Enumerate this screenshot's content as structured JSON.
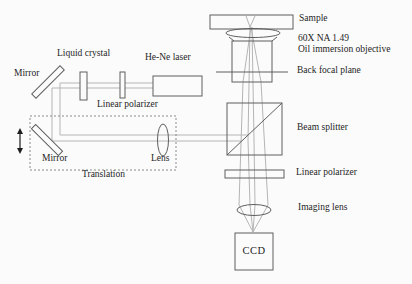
{
  "colors": {
    "background": "#fbfbfb",
    "outline": "#5f5f5f",
    "beam": "#b5b5b5",
    "dotted_box": "#8a8a8a",
    "text": "#1e1e1e"
  },
  "labels": {
    "sample": "Sample",
    "objective_line1": "60X NA 1.49",
    "objective_line2": "Oil immersion objective",
    "back_focal_plane": "Back focal plane",
    "beam_splitter": "Beam splitter",
    "linear_polarizer_bottom": "Linear polarizer",
    "imaging_lens": "Imaging lens",
    "ccd": "CCD",
    "he_ne_laser": "He-Ne laser",
    "liquid_crystal": "Liquid crystal",
    "linear_polarizer_top": "Linear polarizer",
    "mirror_top": "Mirror",
    "mirror_bottom": "Mirror",
    "lens": "Lens",
    "translation": "Translation"
  },
  "components": [
    {
      "name": "sample-slide"
    },
    {
      "name": "oil-immersion-objective"
    },
    {
      "name": "back-focal-plane"
    },
    {
      "name": "beam-splitter"
    },
    {
      "name": "linear-polarizer-output"
    },
    {
      "name": "imaging-lens"
    },
    {
      "name": "ccd-camera"
    },
    {
      "name": "he-ne-laser"
    },
    {
      "name": "linear-polarizer-input"
    },
    {
      "name": "liquid-crystal"
    },
    {
      "name": "mirror-fixed"
    },
    {
      "name": "mirror-translation"
    },
    {
      "name": "lens-translation"
    },
    {
      "name": "translation-stage"
    }
  ]
}
